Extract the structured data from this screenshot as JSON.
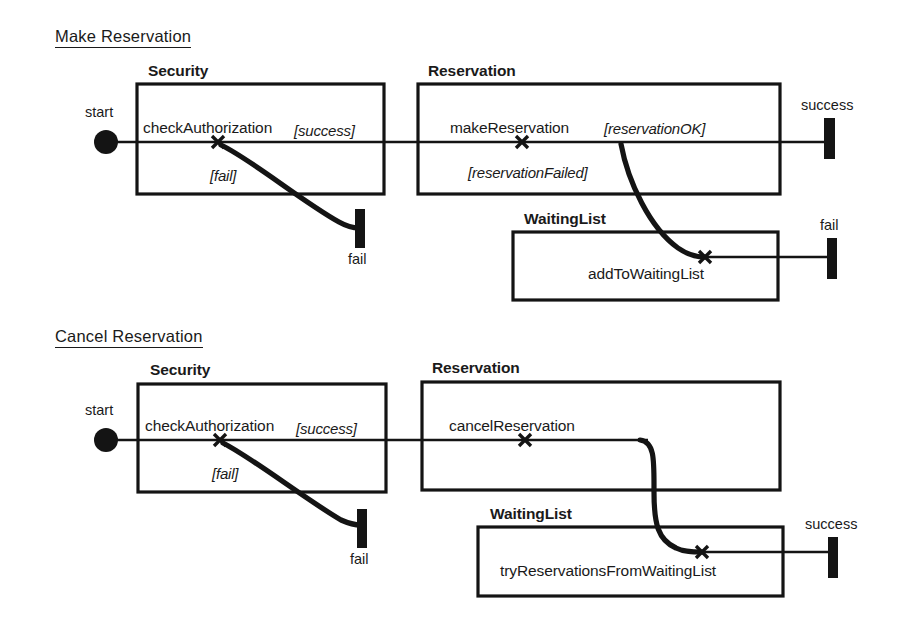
{
  "diagram": {
    "type": "uml-activity-swimlane-diagram",
    "colors": {
      "ink": "#141414",
      "background": "#ffffff"
    },
    "sections": [
      {
        "id": "make-reservation",
        "title": "Make Reservation",
        "start_label": "start",
        "lanes": [
          {
            "id": "security",
            "name": "Security",
            "activity": "checkAuthorization"
          },
          {
            "id": "reservation",
            "name": "Reservation",
            "activity": "makeReservation"
          },
          {
            "id": "waitinglist",
            "name": "WaitingList",
            "activity": "addToWaitingList"
          }
        ],
        "guards": [
          {
            "id": "security-success",
            "text": "[success]"
          },
          {
            "id": "security-fail",
            "text": "[fail]"
          },
          {
            "id": "reservation-ok",
            "text": "[reservationOK]"
          },
          {
            "id": "reservation-failed",
            "text": "[reservationFailed]"
          }
        ],
        "terminals": [
          {
            "id": "security-fail-end",
            "label": "fail"
          },
          {
            "id": "reservation-success-end",
            "label": "success"
          },
          {
            "id": "waitinglist-fail-end",
            "label": "fail"
          }
        ]
      },
      {
        "id": "cancel-reservation",
        "title": "Cancel Reservation",
        "start_label": "start",
        "lanes": [
          {
            "id": "security",
            "name": "Security",
            "activity": "checkAuthorization"
          },
          {
            "id": "reservation",
            "name": "Reservation",
            "activity": "cancelReservation"
          },
          {
            "id": "waitinglist",
            "name": "WaitingList",
            "activity": "tryReservationsFromWaitingList"
          }
        ],
        "guards": [
          {
            "id": "security-success",
            "text": "[success]"
          },
          {
            "id": "security-fail",
            "text": "[fail]"
          }
        ],
        "terminals": [
          {
            "id": "security-fail-end",
            "label": "fail"
          },
          {
            "id": "waitinglist-success-end",
            "label": "success"
          }
        ]
      }
    ]
  }
}
